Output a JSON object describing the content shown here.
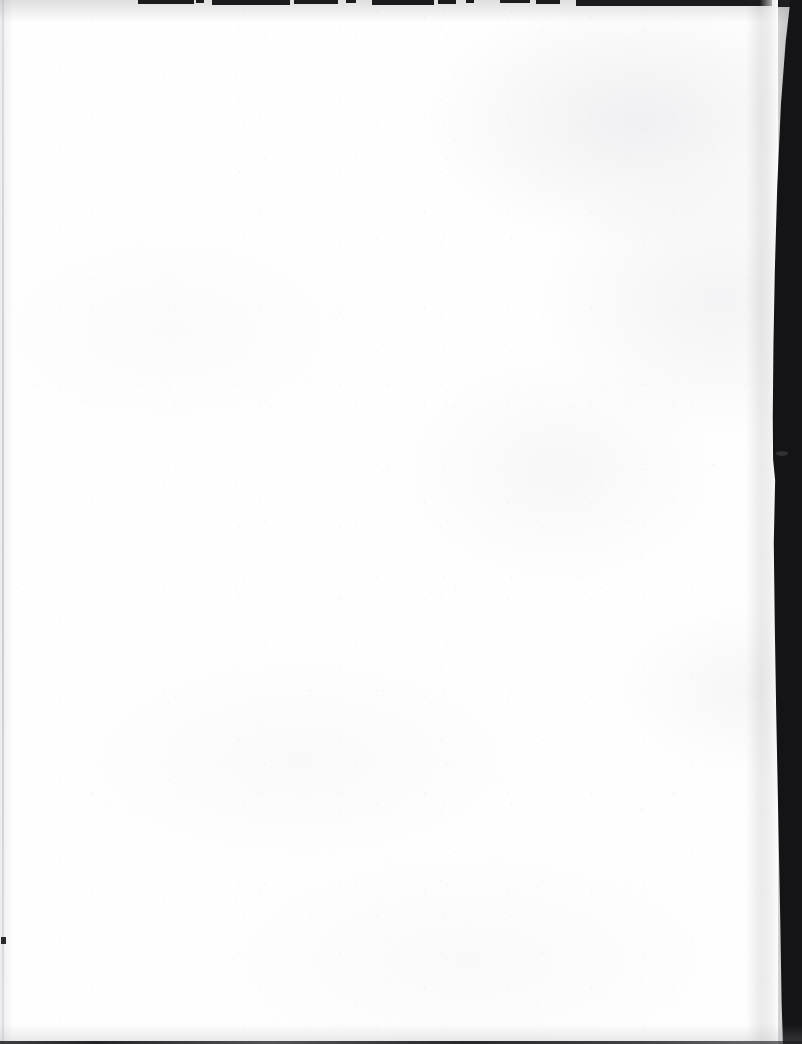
{
  "document": {
    "kind": "scanned-page",
    "page_state": "blank",
    "visible_text": "",
    "page_width_px": 802,
    "page_height_px": 1044,
    "paper_color": "#fefefe",
    "background_color": "#ffffff"
  },
  "scan_artifacts": {
    "top_edge": {
      "name": "top-edge-shadow",
      "description": "intermittent thin dark segments along the very top of the scan",
      "color": "#1b1b1d",
      "segments": [
        {
          "x": 138,
          "width": 56,
          "height": 4
        },
        {
          "x": 196,
          "width": 8,
          "height": 3
        },
        {
          "x": 212,
          "width": 78,
          "height": 5
        },
        {
          "x": 294,
          "width": 44,
          "height": 4
        },
        {
          "x": 346,
          "width": 10,
          "height": 3
        },
        {
          "x": 372,
          "width": 62,
          "height": 5
        },
        {
          "x": 438,
          "width": 18,
          "height": 4
        },
        {
          "x": 466,
          "width": 8,
          "height": 3
        },
        {
          "x": 500,
          "width": 30,
          "height": 3
        },
        {
          "x": 536,
          "width": 24,
          "height": 4
        },
        {
          "x": 576,
          "width": 196,
          "height": 6
        },
        {
          "x": 778,
          "width": 24,
          "height": 7
        }
      ]
    },
    "right_edge": {
      "name": "right-edge-band",
      "description": "dark vertical page-edge shadow band, widest mid-page, curving inward at the top and narrowing toward the bottom",
      "color": "#141416",
      "max_width_px": 34,
      "notch_y": 453
    },
    "left_edge": {
      "name": "left-edge-rule",
      "description": "faint light-gray vertical rule close to the left border",
      "color": "#c6c6cc",
      "x": 2,
      "width": 2
    },
    "left_margin_speck": {
      "name": "left-margin-speck",
      "description": "small dark speck on the left margin",
      "color": "#2a2a2e",
      "x": 1,
      "y": 937
    },
    "bottom_edge": {
      "name": "bottom-edge-rule",
      "description": "thin dark rule along the very bottom of the scan",
      "color": "#141416",
      "height": 3
    }
  }
}
